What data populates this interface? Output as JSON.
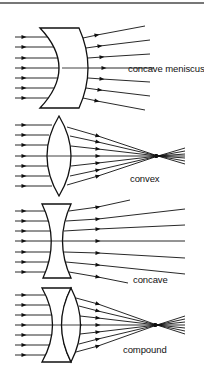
{
  "figure": {
    "colors": {
      "ink": "#111111",
      "background": "#ffffff",
      "rule": "#777777"
    },
    "sections": [
      {
        "id": "concave-meniscus",
        "label": "concave meniscus",
        "behavior": "diverging"
      },
      {
        "id": "convex",
        "label": "convex",
        "behavior": "converging to focal point"
      },
      {
        "id": "concave",
        "label": "concave",
        "behavior": "diverging"
      },
      {
        "id": "compound",
        "label": "compound",
        "behavior": "converging to focal point"
      }
    ],
    "rays_per_lens": 7
  }
}
